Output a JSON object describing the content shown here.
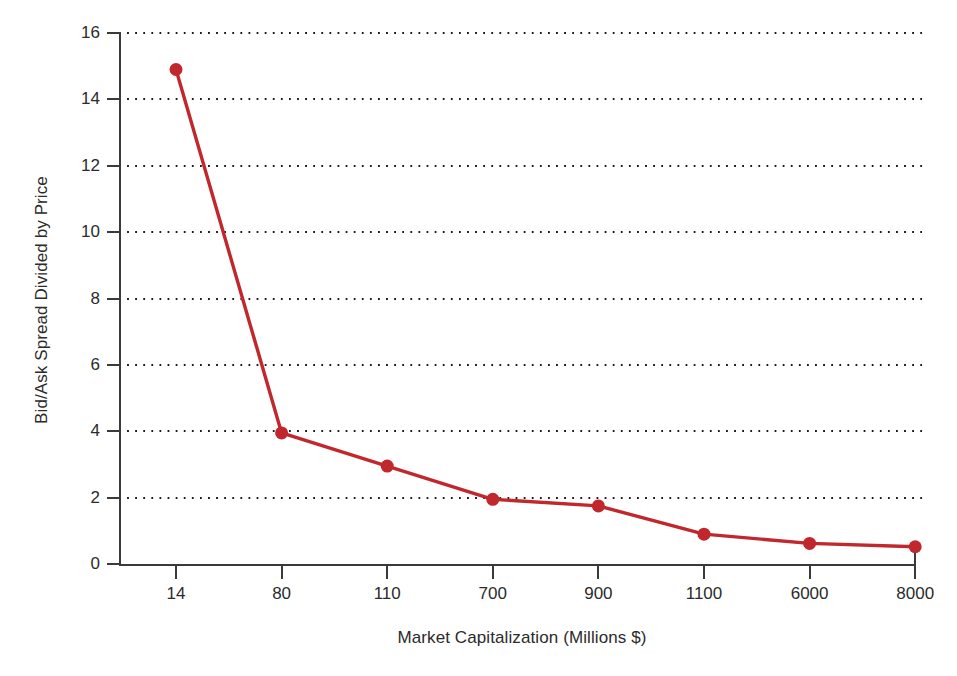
{
  "chart_data": {
    "type": "line",
    "title": "",
    "xlabel": "Market Capitalization (Millions $)",
    "ylabel": "Bid/Ask Spread Divided by Price",
    "categories": [
      "14",
      "80",
      "110",
      "700",
      "900",
      "1100",
      "6000",
      "8000"
    ],
    "values": [
      14.9,
      3.95,
      2.95,
      1.95,
      1.75,
      0.9,
      0.62,
      0.52
    ],
    "xtick_labels": [
      "14",
      "80",
      "110",
      "700",
      "900",
      "1100",
      "6000",
      "8000"
    ],
    "ytick_labels": [
      "0",
      "2",
      "4",
      "6",
      "8",
      "10",
      "12",
      "14",
      "16"
    ],
    "ytick_values": [
      0,
      2,
      4,
      6,
      8,
      10,
      12,
      14,
      16
    ],
    "ylim": [
      0,
      16
    ],
    "grid": "horizontal-dotted",
    "legend": "none",
    "series_color": "#c0282d",
    "marker": "circle",
    "marker_size": 13,
    "axis_color": "#3a3a3a",
    "grid_color": "#1a1a1a",
    "background": "#ffffff"
  }
}
